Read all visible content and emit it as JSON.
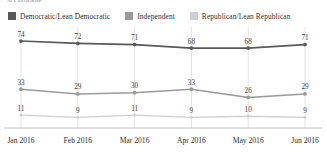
{
  "title": {
    "text": "% Favorable",
    "truncated": true
  },
  "legend": {
    "position": "top",
    "items": [
      {
        "label": "Democratic/Lean Democratic",
        "color": "#595959",
        "swatch_name": "legend-swatch-democratic"
      },
      {
        "label": "Independent",
        "color": "#9a9a9a",
        "swatch_name": "legend-swatch-independent"
      },
      {
        "label": "Republican/Lean Republican",
        "color": "#cfcfcf",
        "swatch_name": "legend-swatch-republican"
      }
    ]
  },
  "chart_data": {
    "type": "line",
    "title": "% Favorable",
    "xlabel": "",
    "ylabel": "",
    "categories": [
      "Jan 2016",
      "Feb 2016",
      "Mar 2016",
      "Apr 2016",
      "May 2016",
      "Jun 2016"
    ],
    "series": [
      {
        "name": "Democratic/Lean Democratic",
        "color": "#595959",
        "values": [
          74,
          72,
          71,
          68,
          68,
          71
        ],
        "labels": [
          "74",
          "72",
          "71",
          "68",
          "68",
          "71"
        ]
      },
      {
        "name": "Independent",
        "color": "#9a9a9a",
        "values": [
          33,
          29,
          30,
          33,
          26,
          29
        ],
        "labels": [
          "33",
          "29",
          "30",
          "33",
          "26",
          "29"
        ]
      },
      {
        "name": "Republican/Lean Republican",
        "color": "#cfcfcf",
        "values": [
          11,
          9,
          11,
          9,
          10,
          9
        ],
        "labels": [
          "11",
          "9",
          "11",
          "9",
          "10",
          "9"
        ]
      }
    ],
    "ylim": [
      0,
      80
    ],
    "grid": "vertical-only",
    "data_labels": true,
    "legend_position": "top"
  },
  "axis": {
    "x_ticks": [
      "Jan 2016",
      "Feb 2016",
      "Mar 2016",
      "Apr 2016",
      "May 2016",
      "Jun 2016"
    ],
    "baseline_color": "#b8b8b8",
    "gridline_color": "#d8d8d8"
  }
}
